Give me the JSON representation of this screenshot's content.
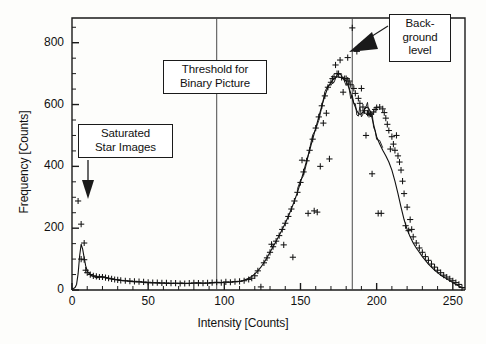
{
  "figure": {
    "name": "intensity-histogram",
    "x_axis_title": "Intensity [Counts]",
    "y_axis_title": "Frequency [Counts]"
  },
  "annotations": [
    {
      "id": "saturated",
      "lines": [
        "Saturated",
        "Star Images"
      ],
      "text": "Saturated Star Images",
      "arrow": "down",
      "points_to_x": 8,
      "points_to_y": 330
    },
    {
      "id": "threshold",
      "lines": [
        "Threshold for",
        "Binary Picture"
      ],
      "text": "Threshold for Binary Picture",
      "arrow": "none",
      "vline_x": 95
    },
    {
      "id": "background",
      "lines": [
        "Back-",
        "ground",
        "level"
      ],
      "text": "Background level",
      "arrow": "diagonal",
      "vline_x": 184
    }
  ],
  "colors": {
    "axis": "#1a1a1a",
    "curve": "#101010",
    "markers": "#141414",
    "vline": "#4a4a4a",
    "background": "#fdfdfb",
    "box_border": "#1a1a1a",
    "box_fill": "#ffffff"
  },
  "chart_data": {
    "type": "line",
    "title": "",
    "subtitle": "",
    "xlabel": "Intensity [Counts]",
    "ylabel": "Frequency [Counts]",
    "xlim": [
      0,
      258
    ],
    "ylim": [
      0,
      880
    ],
    "xticks": [
      0,
      50,
      100,
      150,
      200,
      250
    ],
    "yticks": [
      0,
      200,
      400,
      600,
      800
    ],
    "xtick_labels": [
      "0",
      "50",
      "100",
      "150",
      "200",
      "250"
    ],
    "ytick_labels": [
      "0",
      "200",
      "400",
      "600",
      "800"
    ],
    "minor_ticks": true,
    "grid": false,
    "legend": "none",
    "vertical_lines": [
      {
        "x": 95,
        "label": "Threshold for Binary Picture"
      },
      {
        "x": 184,
        "label": "Background level"
      }
    ],
    "series": [
      {
        "name": "smoothed histogram",
        "style": "line",
        "x": [
          0,
          1,
          2,
          3,
          4,
          5,
          6,
          7,
          8,
          9,
          10,
          11,
          12,
          13,
          14,
          15,
          16,
          17,
          18,
          19,
          20,
          22,
          24,
          26,
          28,
          30,
          32,
          34,
          36,
          38,
          40,
          42,
          44,
          46,
          48,
          50,
          52,
          54,
          56,
          58,
          60,
          62,
          64,
          66,
          68,
          70,
          72,
          74,
          76,
          78,
          80,
          82,
          84,
          86,
          88,
          90,
          92,
          94,
          96,
          98,
          100,
          102,
          104,
          106,
          108,
          110,
          112,
          114,
          116,
          118,
          120,
          122,
          124,
          126,
          128,
          130,
          132,
          134,
          136,
          138,
          140,
          142,
          144,
          146,
          148,
          150,
          152,
          154,
          156,
          158,
          160,
          162,
          164,
          166,
          168,
          170,
          172,
          174,
          176,
          178,
          180,
          181,
          182,
          183,
          184,
          185,
          186,
          187,
          188,
          189,
          190,
          191,
          192,
          193,
          194,
          195,
          196,
          197,
          198,
          199,
          200,
          202,
          204,
          206,
          208,
          210,
          212,
          214,
          216,
          218,
          220,
          222,
          224,
          226,
          228,
          230,
          232,
          234,
          236,
          238,
          240,
          242,
          244,
          246,
          248,
          250,
          252,
          254,
          256,
          257
        ],
        "y": [
          4,
          5,
          8,
          18,
          52,
          110,
          148,
          132,
          104,
          78,
          62,
          55,
          50,
          46,
          44,
          42,
          40,
          40,
          42,
          44,
          43,
          41,
          38,
          36,
          34,
          33,
          31,
          30,
          29,
          28,
          27,
          26,
          26,
          25,
          24,
          24,
          23,
          23,
          22,
          22,
          22,
          21,
          21,
          21,
          22,
          22,
          23,
          22,
          21,
          21,
          22,
          23,
          23,
          22,
          22,
          22,
          23,
          24,
          24,
          24,
          25,
          25,
          26,
          27,
          27,
          28,
          30,
          34,
          38,
          44,
          52,
          62,
          74,
          88,
          104,
          122,
          140,
          158,
          176,
          196,
          216,
          238,
          262,
          288,
          316,
          348,
          382,
          418,
          452,
          488,
          524,
          560,
          596,
          628,
          656,
          672,
          684,
          690,
          688,
          684,
          676,
          664,
          652,
          636,
          620,
          604,
          592,
          580,
          572,
          568,
          570,
          576,
          584,
          590,
          592,
          586,
          574,
          556,
          536,
          516,
          496,
          472,
          452,
          434,
          414,
          388,
          352,
          312,
          268,
          228,
          196,
          172,
          152,
          136,
          122,
          108,
          96,
          84,
          74,
          64,
          56,
          48,
          42,
          36,
          30,
          24,
          18,
          13,
          8,
          5
        ]
      },
      {
        "name": "raw histogram markers",
        "style": "scatter-plus",
        "x": [
          4,
          6,
          6,
          8,
          8,
          9,
          10,
          12,
          14,
          16,
          18,
          20,
          22,
          24,
          26,
          28,
          30,
          32,
          35,
          38,
          41,
          44,
          47,
          50,
          53,
          56,
          59,
          62,
          65,
          68,
          71,
          74,
          77,
          80,
          83,
          86,
          89,
          92,
          95,
          98,
          101,
          104,
          107,
          110,
          113,
          116,
          118,
          120,
          122,
          124,
          126,
          128,
          130,
          131,
          132,
          134,
          136,
          138,
          139,
          140,
          142,
          144,
          145,
          146,
          148,
          150,
          151,
          152,
          154,
          155,
          156,
          158,
          159,
          160,
          161,
          162,
          163,
          164,
          165,
          166,
          167,
          168,
          169,
          170,
          171,
          172,
          173,
          174,
          175,
          176,
          177,
          178,
          179,
          180,
          181,
          182,
          183,
          184,
          185,
          186,
          187,
          188,
          189,
          190,
          191,
          192,
          193,
          194,
          195,
          196,
          197,
          198,
          199,
          200,
          201,
          202,
          203,
          204,
          205,
          206,
          207,
          208,
          209,
          210,
          211,
          212,
          213,
          214,
          215,
          216,
          217,
          218,
          219,
          220,
          221,
          222,
          223,
          224,
          226,
          228,
          230,
          232,
          234,
          236,
          238,
          240,
          242,
          244,
          246,
          248,
          250,
          252,
          254,
          256
        ],
        "y": [
          288,
          213,
          100,
          152,
          98,
          64,
          56,
          50,
          46,
          44,
          42,
          42,
          40,
          38,
          36,
          34,
          33,
          31,
          30,
          29,
          28,
          27,
          26,
          25,
          24,
          24,
          23,
          23,
          22,
          22,
          21,
          21,
          22,
          23,
          22,
          22,
          23,
          24,
          25,
          24,
          26,
          25,
          27,
          28,
          30,
          34,
          38,
          46,
          62,
          10,
          88,
          104,
          122,
          148,
          140,
          158,
          176,
          196,
          146,
          216,
          238,
          262,
          106,
          288,
          316,
          348,
          420,
          382,
          418,
          248,
          452,
          488,
          256,
          524,
          252,
          560,
          400,
          596,
          540,
          628,
          572,
          656,
          424,
          672,
          684,
          690,
          728,
          700,
          700,
          744,
          688,
          640,
          684,
          684,
          752,
          676,
          664,
          848,
          652,
          636,
          772,
          620,
          604,
          652,
          592,
          580,
          500,
          572,
          568,
          570,
          376,
          576,
          584,
          590,
          248,
          592,
          248,
          586,
          574,
          556,
          536,
          516,
          456,
          496,
          472,
          452,
          500,
          434,
          414,
          388,
          352,
          312,
          208,
          268,
          192,
          228,
          196,
          172,
          152,
          136,
          122,
          108,
          96,
          84,
          74,
          64,
          56,
          48,
          42,
          36,
          30,
          24,
          18,
          8
        ]
      }
    ]
  }
}
